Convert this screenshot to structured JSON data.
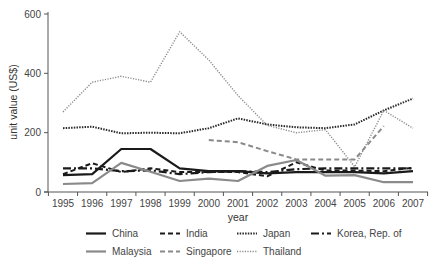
{
  "chart_data": {
    "type": "line",
    "title": "",
    "xlabel": "year",
    "ylabel": "unit value (US$)",
    "ylim": [
      0,
      600
    ],
    "yticks": [
      0,
      200,
      400,
      600
    ],
    "grid": false,
    "legend_position": "bottom",
    "x": [
      "1995",
      "1996",
      "1997",
      "1998",
      "1999",
      "2000",
      "2001",
      "2002",
      "2003",
      "2004",
      "2005",
      "2006",
      "2007"
    ],
    "series": [
      {
        "name": "China",
        "style": "solid",
        "color": "#1a1a1a",
        "width": 2.2,
        "values": [
          57,
          60,
          145,
          145,
          80,
          70,
          70,
          63,
          67,
          67,
          67,
          63,
          70
        ]
      },
      {
        "name": "India",
        "style": "dashed",
        "color": "#1a1a1a",
        "width": 2,
        "values": [
          60,
          97,
          67,
          80,
          67,
          67,
          67,
          53,
          100,
          72,
          72,
          70,
          82
        ]
      },
      {
        "name": "Japan",
        "style": "dotted",
        "color": "#2a2a2a",
        "width": 2,
        "values": [
          215,
          220,
          198,
          200,
          198,
          215,
          248,
          228,
          218,
          215,
          228,
          275,
          315
        ]
      },
      {
        "name": "Korea, Rep. of",
        "style": "dashdot",
        "color": "#1a1a1a",
        "width": 2.2,
        "values": [
          80,
          80,
          70,
          73,
          60,
          67,
          70,
          67,
          77,
          80,
          80,
          80,
          80
        ]
      },
      {
        "name": "Malaysia",
        "style": "solid",
        "color": "#8a8a8a",
        "width": 2.2,
        "values": [
          27,
          30,
          98,
          68,
          37,
          45,
          37,
          88,
          108,
          55,
          57,
          33,
          33
        ]
      },
      {
        "name": "Singapore",
        "style": "dashed",
        "color": "#8a8a8a",
        "width": 2,
        "values": [
          null,
          null,
          null,
          null,
          null,
          175,
          168,
          138,
          110,
          110,
          110,
          222,
          null
        ]
      },
      {
        "name": "Thailand",
        "style": "dotted",
        "color": "#8a8a8a",
        "width": 1.4,
        "values": [
          270,
          370,
          390,
          370,
          540,
          445,
          325,
          225,
          200,
          210,
          85,
          275,
          215
        ]
      }
    ]
  },
  "axes": {
    "xlabel": "year",
    "ylabel": "unit value (US$)"
  },
  "legend": {
    "items": [
      "China",
      "India",
      "Japan",
      "Korea, Rep. of",
      "Malaysia",
      "Singapore",
      "Thailand"
    ]
  }
}
